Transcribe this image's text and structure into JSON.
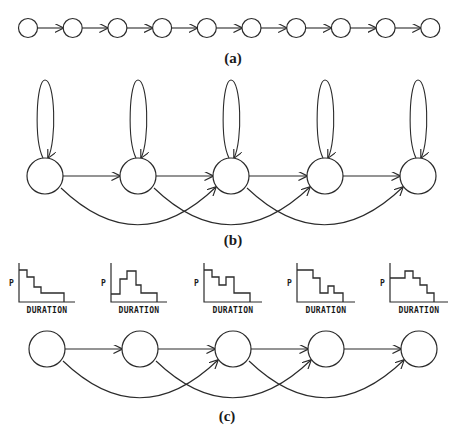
{
  "figure": {
    "panels": [
      {
        "id": "a",
        "caption": "(a)",
        "description": "Linear chain of 10 states with forward transitions",
        "node_count": 10,
        "edges": "i -> i+1"
      },
      {
        "id": "b",
        "caption": "(b)",
        "description": "5 states with self-loops, forward transitions and skip transitions",
        "node_count": 5,
        "edges": "self-loop, i -> i+1, i -> i+2"
      },
      {
        "id": "c",
        "caption": "(c)",
        "description": "5 states with explicit duration distributions, forward and skip transitions",
        "node_count": 5,
        "edges": "i -> i+1, i -> i+2",
        "histograms": [
          {
            "ylabel": "P",
            "xlabel": "DURATION"
          },
          {
            "ylabel": "P",
            "xlabel": "DURATION"
          },
          {
            "ylabel": "P",
            "xlabel": "DURATION"
          },
          {
            "ylabel": "P",
            "xlabel": "DURATION"
          },
          {
            "ylabel": "P",
            "xlabel": "DURATION"
          }
        ]
      }
    ],
    "colors": {
      "stroke": "#2b2b2b",
      "background": "#ffffff",
      "text": "#1a1a1a"
    }
  }
}
